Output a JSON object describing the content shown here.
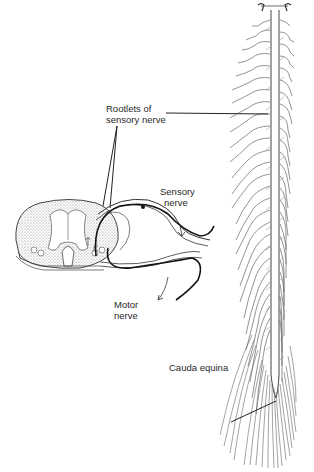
{
  "figure": {
    "labels": {
      "rootlets": {
        "line1": "Rootlets of",
        "line2": "sensory nerve"
      },
      "sensory": {
        "line1": "Sensory",
        "line2": "nerve"
      },
      "motor": {
        "line1": "Motor",
        "line2": "nerve"
      },
      "cauda": {
        "line1": "Cauda equina"
      }
    },
    "colors": {
      "ink": "#2a2a2a",
      "stipple": "#8a8a8a",
      "background": "#ffffff"
    }
  }
}
